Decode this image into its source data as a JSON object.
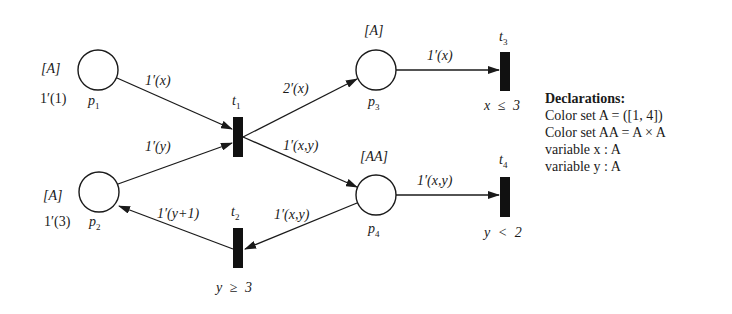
{
  "places": [
    {
      "id": "p1",
      "name": "p1",
      "colorset": "[A]",
      "marking": "1′(1)",
      "cx": 98,
      "cy": 70
    },
    {
      "id": "p2",
      "name": "p2",
      "colorset": "[A]",
      "marking": "1′(3)",
      "cx": 99,
      "cy": 192
    },
    {
      "id": "p3",
      "name": "p3",
      "colorset": "[A]",
      "marking": "",
      "cx": 376,
      "cy": 70
    },
    {
      "id": "p4",
      "name": "p4",
      "colorset": "[AA]",
      "marking": "",
      "cx": 376,
      "cy": 195
    }
  ],
  "transitions": [
    {
      "id": "t1",
      "name": "t1",
      "guard": ""
    },
    {
      "id": "t2",
      "name": "t2",
      "guard": "y ≥ 3"
    },
    {
      "id": "t3",
      "name": "t3",
      "guard": "x ≤ 3"
    },
    {
      "id": "t4",
      "name": "t4",
      "guard": "y < 2"
    }
  ],
  "arcs": [
    {
      "from": "p1",
      "to": "t1",
      "inscription": "1′(x)"
    },
    {
      "from": "p2",
      "to": "t1",
      "inscription": "1′(y)"
    },
    {
      "from": "t1",
      "to": "p3",
      "inscription": "2′(x)"
    },
    {
      "from": "t1",
      "to": "p4",
      "inscription": "1′(x,y)"
    },
    {
      "from": "p3",
      "to": "t3",
      "inscription": "1′(x)"
    },
    {
      "from": "p4",
      "to": "t4",
      "inscription": "1′(x,y)"
    },
    {
      "from": "p4",
      "to": "t2",
      "inscription": "1′(x,y)"
    },
    {
      "from": "t2",
      "to": "p2",
      "inscription": "1′(y+1)"
    }
  ],
  "declarations": {
    "title": "Declarations:",
    "lines": [
      "Color set A = ([1, 4])",
      "Color set AA = A × A",
      "variable x : A",
      "variable y : A"
    ]
  }
}
